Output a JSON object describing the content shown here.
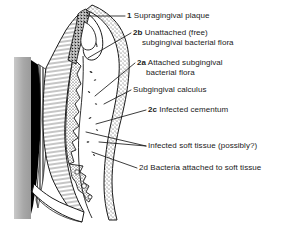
{
  "figure": {
    "labels": [
      {
        "id": "supragingival-plaque",
        "tag": "1",
        "text": "Supragingival plaque",
        "sub": ""
      },
      {
        "id": "unattached-subgingival-flora",
        "tag": "2b",
        "text": "Unattached (free)",
        "sub": "subgingival bacterial flora"
      },
      {
        "id": "attached-subgingival-flora",
        "tag": "2a",
        "text": "Attached subgingival",
        "sub": "bacterial flora"
      },
      {
        "id": "subgingival-calculus",
        "tag": "",
        "text": "Subgingival calculus",
        "sub": ""
      },
      {
        "id": "infected-cementum",
        "tag": "2c",
        "text": "Infected cementum",
        "sub": ""
      },
      {
        "id": "infected-soft-tissue",
        "tag": "",
        "text": "Infected soft tissue (possibly?)",
        "sub": ""
      },
      {
        "id": "bacteria-attached-soft-tissue",
        "tag": "2d",
        "text": "Bacteria attached to soft tissue",
        "sub": ""
      }
    ],
    "colors": {
      "ink": "#1a1a1a",
      "background": "#ffffff",
      "pulp_band": "#000000",
      "enamel_edge_grey": "#a8a8a8",
      "gingiva_stipple": "#3a3a3a",
      "plaque_speckle": "#111111"
    }
  }
}
